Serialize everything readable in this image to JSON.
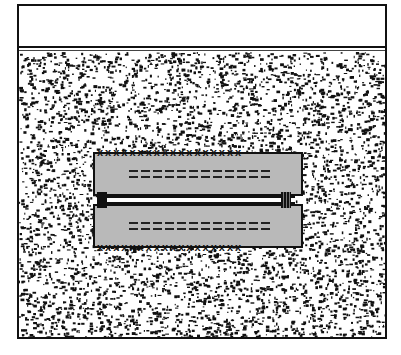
{
  "diagram": {
    "type": "cross-section illustration",
    "regions": {
      "sky": {
        "label": "",
        "color": "#ffffff"
      },
      "ground_surface": {
        "label": "",
        "color": "#111111"
      },
      "soil": {
        "label": "",
        "pattern": "speckle",
        "colors": [
          "#111111",
          "#ffffff"
        ]
      },
      "object": {
        "upper_panel": {
          "fill": "#b9b9b9",
          "dash_rows": 2,
          "edge_marks": "xxxxxxxxxxxxxxxxxx"
        },
        "lower_panel": {
          "fill": "#b9b9b9",
          "dash_rows": 2,
          "edge_marks": "xxxxxxxxxxxxxxxxxx"
        },
        "seam": {
          "fill": "#ffffff"
        },
        "left_fitting": {
          "shape": "block"
        },
        "right_fitting": {
          "shape": "ribbed"
        }
      }
    },
    "text_labels": []
  }
}
